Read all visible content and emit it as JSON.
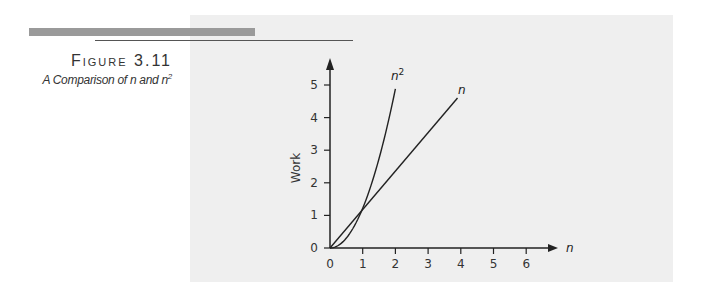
{
  "figure": {
    "number_label": "Figure 3.11",
    "caption_prefix": "A Comparison of ",
    "caption_n": "n",
    "caption_and": " and ",
    "caption_n2": "n",
    "caption_sup": "2"
  },
  "chart_data": {
    "type": "line",
    "xlabel": "n",
    "ylabel": "Work",
    "xlim": [
      0,
      6.5
    ],
    "ylim": [
      0,
      5.6
    ],
    "x_ticks": [
      "0",
      "1",
      "2",
      "3",
      "4",
      "5",
      "6"
    ],
    "y_ticks": [
      "0",
      "1",
      "2",
      "3",
      "4",
      "5"
    ],
    "grid": false,
    "legend": "inline labels at line ends",
    "series": [
      {
        "name": "n^2",
        "label": "n",
        "label_sup": "2",
        "x": [
          0,
          0.5,
          1,
          1.5,
          2.0
        ],
        "values": [
          0,
          0.3,
          1.2,
          2.8,
          4.9
        ]
      },
      {
        "name": "n",
        "label": "n",
        "label_sup": "",
        "x": [
          0,
          1,
          2,
          3,
          3.9
        ],
        "values": [
          0,
          1.2,
          2.4,
          3.6,
          4.6
        ]
      }
    ]
  }
}
